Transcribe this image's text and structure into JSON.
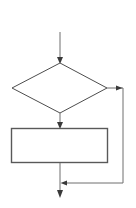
{
  "figure": {
    "title": "",
    "background_color": "#ffffff",
    "stroke_color": "#4d4d4d",
    "shape_fill": "#ffffff",
    "width": 136,
    "height": 208,
    "caption_text": ""
  },
  "diagram_data": {
    "type": "flowchart",
    "orientation": "top-to-bottom",
    "has_labels": false,
    "nodes": [
      {
        "id": "entry",
        "shape": "arrow-start",
        "label": "",
        "x": 60,
        "y": 32
      },
      {
        "id": "decision",
        "shape": "diamond",
        "label": "",
        "center_x": 60,
        "center_y": 88,
        "half_width": 48,
        "half_height": 25,
        "top": 63,
        "bottom": 113,
        "left": 12,
        "right": 107
      },
      {
        "id": "process",
        "shape": "rectangle",
        "label": "",
        "x": 11,
        "y": 128,
        "width": 97,
        "height": 35
      },
      {
        "id": "exit",
        "shape": "arrow-end",
        "label": "",
        "x": 60,
        "y": 197
      }
    ],
    "edges": [
      {
        "id": "edge-entry-decision",
        "from": "entry",
        "to": "decision",
        "label": "",
        "arrowhead": true,
        "path": "M 60 32 L 60 63"
      },
      {
        "id": "edge-decision-process",
        "from": "decision",
        "to": "process",
        "label": "",
        "arrowhead": true,
        "path": "M 60 113 L 60 128"
      },
      {
        "id": "edge-process-exit",
        "from": "process",
        "to": "exit",
        "label": "",
        "arrowhead": true,
        "path": "M 60 163 L 60 197"
      },
      {
        "id": "edge-feedback-loop",
        "from": "decision",
        "to": "edge-process-exit",
        "label": "",
        "arrowhead": true,
        "path": "M 107 88 L 123 88 L 123 183 L 62 183",
        "description": "feedback loop from decision right vertex down and back into main flow"
      }
    ],
    "loop_arrowheads": [
      {
        "id": "loop-corner-arrow",
        "x": 121,
        "y": 88,
        "direction": "right"
      },
      {
        "id": "loop-return-arrow",
        "x": 62,
        "y": 183,
        "direction": "left"
      }
    ]
  }
}
